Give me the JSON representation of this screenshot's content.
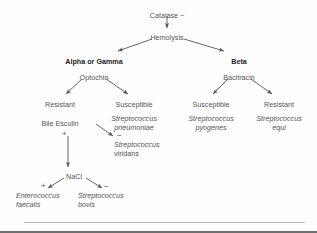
{
  "diagram": {
    "background_color": "#fefefe",
    "text_color": "#555555",
    "accent_color": "#1d1d1d",
    "line_color": "#555555",
    "nodes": [
      {
        "id": "catalase",
        "label": "Catalase −",
        "x": 167,
        "y": 11,
        "style": "plain"
      },
      {
        "id": "hemolysis",
        "label": "Hemolysis",
        "x": 167,
        "y": 33,
        "style": "plain"
      },
      {
        "id": "alpha-or-gamma",
        "label": "Alpha or Gamma",
        "x": 94,
        "y": 57,
        "style": "bold"
      },
      {
        "id": "beta",
        "label": "Beta",
        "x": 239,
        "y": 57,
        "style": "bold"
      },
      {
        "id": "optochin",
        "label": "Optochin",
        "x": 94,
        "y": 73,
        "style": "plain"
      },
      {
        "id": "bacitracin",
        "label": "Bacitracin",
        "x": 239,
        "y": 73,
        "style": "plain"
      },
      {
        "id": "optochin-resistant",
        "label": "Resistant",
        "x": 60,
        "y": 100,
        "style": "plain"
      },
      {
        "id": "optochin-susceptible",
        "label": "Susceptible",
        "x": 134,
        "y": 100,
        "style": "plain"
      },
      {
        "id": "bacitracin-susceptible",
        "label": "Susceptible",
        "x": 211,
        "y": 100,
        "style": "plain"
      },
      {
        "id": "bacitracin-resistant",
        "label": "Resistant",
        "x": 279,
        "y": 100,
        "style": "plain"
      },
      {
        "id": "bile-esculin",
        "label": "Bile Esculin",
        "x": 60,
        "y": 119,
        "style": "plain"
      },
      {
        "id": "nacl",
        "label": "NaCl",
        "x": 74,
        "y": 172,
        "style": "plain"
      }
    ],
    "organisms": [
      {
        "id": "s-pneumoniae",
        "genus": "Streptococcus",
        "species": "pneumoniae",
        "x": 134,
        "y": 114
      },
      {
        "id": "s-pyogenes",
        "genus": "Streptococcus",
        "species": "pyogenes",
        "x": 211,
        "y": 114
      },
      {
        "id": "s-equi",
        "genus": "Streptococcus",
        "species": "equi",
        "x": 279,
        "y": 114
      },
      {
        "id": "s-viridans",
        "genus": "Streptococcus",
        "species": "viridans",
        "x": 129,
        "y": 143
      },
      {
        "id": "e-faecalis",
        "genus": "Enterococcus",
        "species": "faecalis",
        "x": 20,
        "y": 194
      },
      {
        "id": "s-bovis",
        "genus": "Streptococcus",
        "species": "bovis",
        "x": 81,
        "y": 194
      }
    ],
    "signs": [
      {
        "id": "bile-esculin-positive",
        "label": "+",
        "x": 62,
        "y": 130
      },
      {
        "id": "bile-esculin-negative",
        "label": "−",
        "x": 117,
        "y": 132
      },
      {
        "id": "nacl-positive",
        "label": "+",
        "x": 41,
        "y": 182
      },
      {
        "id": "nacl-negative",
        "label": "−",
        "x": 104,
        "y": 183
      }
    ],
    "edges": [
      {
        "id": "catalase-to-hemolysis",
        "from": "catalase",
        "to": "hemolysis"
      },
      {
        "id": "hemolysis-to-alpha-or-gamma",
        "from": "hemolysis",
        "to": "alpha-or-gamma"
      },
      {
        "id": "hemolysis-to-beta",
        "from": "hemolysis",
        "to": "beta"
      },
      {
        "id": "optochin-to-resistant",
        "from": "optochin",
        "to": "optochin-resistant"
      },
      {
        "id": "optochin-to-susceptible",
        "from": "optochin",
        "to": "optochin-susceptible"
      },
      {
        "id": "bacitracin-to-susceptible",
        "from": "bacitracin",
        "to": "bacitracin-susceptible"
      },
      {
        "id": "bacitracin-to-resistant",
        "from": "bacitracin",
        "to": "bacitracin-resistant"
      },
      {
        "id": "bile-esculin-to-nacl",
        "from": "bile-esculin",
        "to": "nacl"
      },
      {
        "id": "bile-esculin-to-viridans",
        "from": "bile-esculin",
        "to": "s-viridans"
      },
      {
        "id": "nacl-to-faecalis",
        "from": "nacl",
        "to": "e-faecalis"
      },
      {
        "id": "nacl-to-bovis",
        "from": "nacl",
        "to": "s-bovis"
      }
    ]
  }
}
